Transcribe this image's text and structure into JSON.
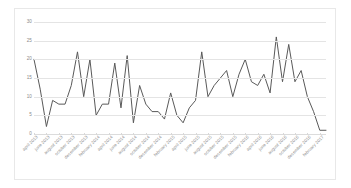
{
  "chart_data": {
    "type": "line",
    "title": "",
    "subtitle": "",
    "xlabel": "",
    "ylabel": "",
    "ylim": [
      0,
      30
    ],
    "y_ticks": [
      0,
      5,
      10,
      15,
      20,
      25,
      30
    ],
    "grid": true,
    "legend": "none",
    "line_color": "#595959",
    "categories": [
      "april 2013",
      "may 2013",
      "june 2013",
      "july 2013",
      "august 2013",
      "september 2013",
      "october 2013",
      "november 2013",
      "december 2013",
      "january 2014",
      "february 2014",
      "march 2014",
      "april 2014",
      "may 2014",
      "june 2014",
      "july 2014",
      "august 2014",
      "september 2014",
      "october 2014",
      "november 2014",
      "december 2014",
      "january 2015",
      "february 2015",
      "march 2015",
      "april 2015",
      "may 2015",
      "june 2015",
      "july 2015",
      "august 2015",
      "september 2015",
      "october 2015",
      "november 2015",
      "december 2015",
      "january 2016",
      "february 2016",
      "march 2016",
      "april 2016",
      "may 2016",
      "june 2016",
      "july 2016",
      "august 2016",
      "september 2016",
      "october 2016",
      "november 2016",
      "december 2016",
      "january 2017",
      "february 2017",
      "march 2017"
    ],
    "x_tick_labels": [
      "april 2013",
      "june 2013",
      "august 2013",
      "october 2013",
      "december 2013",
      "february 2014",
      "april 2014",
      "june 2014",
      "august 2014",
      "october 2014",
      "december 2014",
      "february 2015",
      "april 2015",
      "june 2015",
      "august 2015",
      "october 2015",
      "december 2015",
      "february 2016",
      "april 2016",
      "june 2016",
      "august 2016",
      "october 2016",
      "december 2016",
      "february 2017"
    ],
    "values": [
      20,
      12,
      2,
      9,
      8,
      8,
      13,
      22,
      10,
      20,
      5,
      8,
      8,
      19,
      7,
      21,
      3,
      13,
      8,
      6,
      6,
      4,
      11,
      5,
      3,
      7,
      9,
      22,
      10,
      13,
      15,
      17,
      10,
      16,
      20,
      14,
      13,
      16,
      11,
      26,
      14,
      24,
      14,
      17,
      10,
      6,
      1,
      1
    ]
  }
}
